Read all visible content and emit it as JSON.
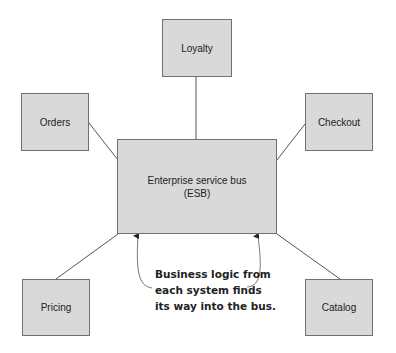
{
  "diagram": {
    "hub": {
      "line1": "Enterprise service bus",
      "line2": "(ESB)"
    },
    "systems": {
      "loyalty": "Loyalty",
      "orders": "Orders",
      "checkout": "Checkout",
      "pricing": "Pricing",
      "catalog": "Catalog"
    },
    "callout": {
      "line1": "Business logic from",
      "line2": "each system finds",
      "line3": "its way into the bus."
    },
    "colors": {
      "box_fill": "#d9d9d9",
      "box_border": "#707070",
      "line": "#555555"
    }
  }
}
